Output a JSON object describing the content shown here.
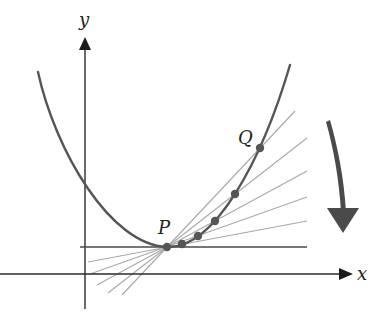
{
  "figure": {
    "colors": {
      "axis": "#2a2a2a",
      "curve": "#555555",
      "secant": "#a8a8a8",
      "tangent": "#4a4a4a",
      "points": "#555555",
      "arrow": "#4a4a4a"
    },
    "axes": {
      "x_label": "x",
      "y_label": "y"
    },
    "labels": {
      "P": "P",
      "Q": "Q"
    },
    "points": [
      {
        "name": "P",
        "px": 167,
        "py": 247
      },
      {
        "name": "Q5",
        "px": 182,
        "py": 244
      },
      {
        "name": "Q4",
        "px": 198,
        "py": 236
      },
      {
        "name": "Q3",
        "px": 215,
        "py": 221
      },
      {
        "name": "Q2",
        "px": 235,
        "py": 194
      },
      {
        "name": "Q",
        "px": 260,
        "py": 148
      }
    ],
    "arrow_direction": "down",
    "annotation": "As Q moves toward P along the curve, the secant lines approach the tangent line at P"
  }
}
